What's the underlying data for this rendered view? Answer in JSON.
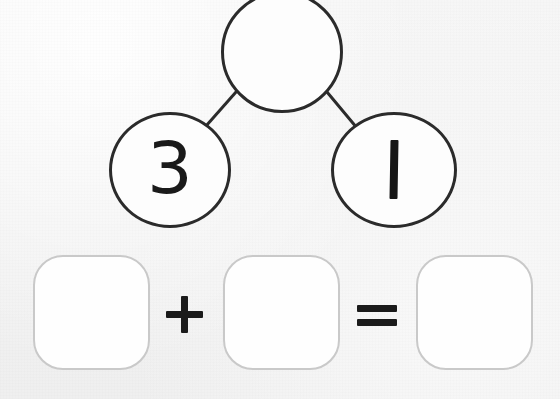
{
  "worksheet": {
    "type": "number-bond-addition",
    "background_color": "#f3f3f3",
    "ink_color": "#1b1b1b",
    "box_border_color": "#c9c9c9"
  },
  "number_bond": {
    "total": {
      "label": "",
      "value": "",
      "filled": false,
      "shape": "circle"
    },
    "parts": [
      {
        "label": "3",
        "value": "3",
        "filled": true,
        "shape": "circle",
        "glyph": "digit-three"
      },
      {
        "label": "1",
        "value": "1",
        "filled": true,
        "shape": "circle",
        "glyph": "vertical-stroke-one"
      }
    ],
    "connectors": [
      {
        "name": "connector-total-to-left"
      },
      {
        "name": "connector-total-to-right"
      }
    ]
  },
  "equation": {
    "operands": [
      {
        "name": "addend-1",
        "value": "",
        "filled": false
      },
      {
        "name": "addend-2",
        "value": "",
        "filled": false
      },
      {
        "name": "sum",
        "value": "",
        "filled": false
      }
    ],
    "operators": {
      "plus": "+",
      "equals": "="
    }
  },
  "accessibility": {
    "description": "Number bond with empty whole, parts 3 and 1, and an empty addition sentence below."
  }
}
